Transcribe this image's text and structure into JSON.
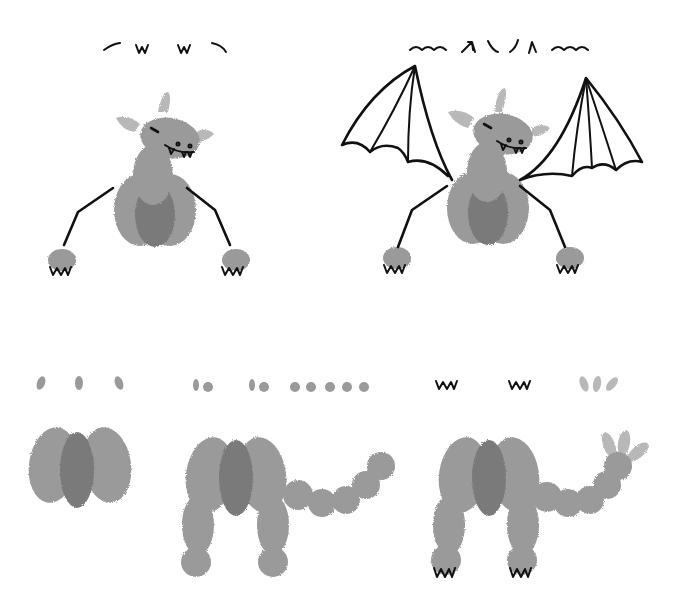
{
  "illustration": {
    "subject": "thumbprint-bat-drawing-steps",
    "colors": {
      "print": "#9a9a9a",
      "print_dark": "#7a7a7a",
      "ear": "#b8b8b8",
      "ink": "#111111",
      "background": "#ffffff"
    },
    "steps": [
      {
        "id": 1,
        "label": "step-1-body-prints",
        "row": "bottom",
        "position": "left"
      },
      {
        "id": 2,
        "label": "step-2-legs-and-tail-prints",
        "row": "bottom",
        "position": "middle"
      },
      {
        "id": 3,
        "label": "step-3-claws-and-ears",
        "row": "bottom",
        "position": "right"
      },
      {
        "id": 4,
        "label": "step-4-arms-and-face",
        "row": "top",
        "position": "left"
      },
      {
        "id": 5,
        "label": "step-5-wings",
        "row": "top",
        "position": "right"
      }
    ]
  }
}
